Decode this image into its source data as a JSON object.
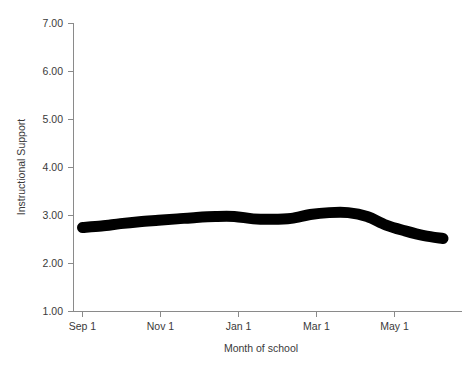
{
  "chart_data": {
    "type": "line",
    "title": "",
    "subtitle": "",
    "xlabel": "Month of school",
    "ylabel": "Instructional Support",
    "xlim": [
      0,
      10
    ],
    "ylim": [
      1.0,
      7.0
    ],
    "grid": false,
    "legend": null,
    "line_color": "#000000",
    "x_tick_labels": [
      "Sep 1",
      "Nov 1",
      "Jan 1",
      "Mar 1",
      "May 1"
    ],
    "x_tick_values": [
      0,
      2,
      4,
      6,
      8
    ],
    "y_tick_labels": [
      "1.00",
      "2.00",
      "3.00",
      "4.00",
      "5.00",
      "6.00",
      "7.00"
    ],
    "y_tick_values": [
      1.0,
      2.0,
      3.0,
      4.0,
      5.0,
      6.0,
      7.0
    ],
    "series": [
      {
        "name": "Instructional Support",
        "x": [
          0.0,
          0.5,
          1.0,
          1.5,
          2.0,
          2.5,
          3.0,
          3.5,
          4.0,
          4.5,
          5.0,
          5.5,
          6.0,
          6.5,
          7.0,
          7.5,
          8.0,
          8.5,
          9.0,
          9.5
        ],
        "y": [
          2.75,
          2.78,
          2.83,
          2.87,
          2.9,
          2.93,
          2.96,
          2.98,
          2.98,
          2.93,
          2.92,
          2.94,
          3.02,
          3.06,
          3.06,
          2.98,
          2.8,
          2.68,
          2.58,
          2.52
        ]
      }
    ]
  },
  "axis": {
    "y_title": "Instructional Support",
    "x_title": "Month of school"
  }
}
